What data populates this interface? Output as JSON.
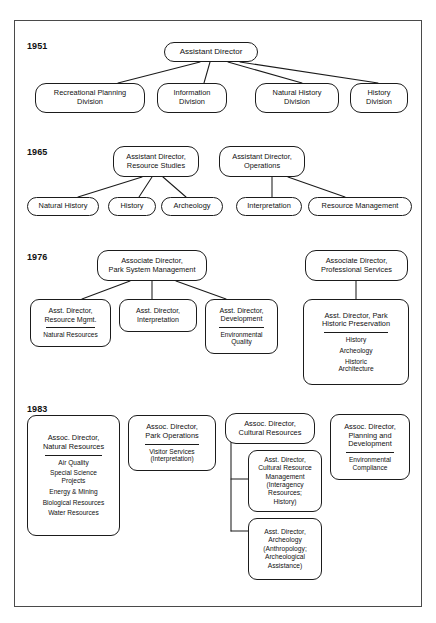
{
  "document": {
    "title": "National Park Service reorganization chart, 1951-1983",
    "border_color": "#4a4a4a",
    "node_border_color": "#1b1b1b",
    "background": "#ffffff"
  },
  "sections": [
    {
      "year": "1951",
      "head": {
        "label": "Assistant Director"
      },
      "children": [
        {
          "label": "Recreational Planning Division"
        },
        {
          "label": "Information Division"
        },
        {
          "label": "Natural History Division"
        },
        {
          "label": "History Division"
        }
      ]
    },
    {
      "year": "1965",
      "groups": [
        {
          "head": {
            "label": "Assistant Director, Resource Studies"
          },
          "children": [
            {
              "label": "Natural History"
            },
            {
              "label": "History"
            },
            {
              "label": "Archeology"
            }
          ]
        },
        {
          "head": {
            "label": "Assistant Director, Operations"
          },
          "children": [
            {
              "label": "Interpretation"
            },
            {
              "label": "Resource Management"
            }
          ]
        }
      ]
    },
    {
      "year": "1976",
      "groups": [
        {
          "head": {
            "label": "Associate Director, Park System Management"
          },
          "children": [
            {
              "label": "Asst. Director, Resource Mgmt.",
              "items": [
                "Natural Resources"
              ]
            },
            {
              "label": "Asst. Director, Interpretation",
              "items": []
            },
            {
              "label": "Asst. Director, Development",
              "items": [
                "Environmental Quality"
              ]
            }
          ]
        },
        {
          "head": {
            "label": "Associate Director, Professional Services"
          },
          "children": [
            {
              "label": "Asst. Director, Park Historic Preservation",
              "items": [
                "History",
                "Archeology",
                "Historic Architecture"
              ]
            }
          ]
        }
      ]
    },
    {
      "year": "1983",
      "columns": [
        {
          "head": {
            "label": "Assoc. Director, Natural Resources"
          },
          "items": [
            "Air Quality",
            "Special Science Projects",
            "Energy & Mining",
            "Biological Resources",
            "Water Resources"
          ]
        },
        {
          "head": {
            "label": "Assoc. Director, Park Operations"
          },
          "items": [
            "Visitor Services (Interpretation)"
          ]
        },
        {
          "head": {
            "label": "Assoc. Director, Cultural Resources"
          },
          "children": [
            {
              "label": "Asst. Director, Cultural Resource Management (Interagency Resources; History)"
            },
            {
              "label": "Asst. Director, Archeology (Anthropology; Archeological Assistance)"
            }
          ]
        },
        {
          "head": {
            "label": "Assoc. Director, Planning and Development"
          },
          "items": [
            "Environmental Compliance"
          ]
        }
      ]
    }
  ],
  "labels": {
    "y1951": "1951",
    "y1965": "1965",
    "y1976": "1976",
    "y1983": "1983",
    "n1951_head": "Assistant Director",
    "n1951_c1_l1": "Recreational Planning",
    "n1951_c1_l2": "Division",
    "n1951_c2_l1": "Information",
    "n1951_c2_l2": "Division",
    "n1951_c3_l1": "Natural History",
    "n1951_c3_l2": "Division",
    "n1951_c4_l1": "History",
    "n1951_c4_l2": "Division",
    "n1965_h1_l1": "Assistant Director,",
    "n1965_h1_l2": "Resource Studies",
    "n1965_h2_l1": "Assistant Director,",
    "n1965_h2_l2": "Operations",
    "n1965_c1": "Natural History",
    "n1965_c2": "History",
    "n1965_c3": "Archeology",
    "n1965_c4": "Interpretation",
    "n1965_c5": "Resource Management",
    "n1976_h1_l1": "Associate Director,",
    "n1976_h1_l2": "Park System Management",
    "n1976_h2_l1": "Associate Director,",
    "n1976_h2_l2": "Professional Services",
    "n1976_a_l1": "Asst. Director,",
    "n1976_a_l2": "Resource Mgmt.",
    "n1976_a_s1": "Natural Resources",
    "n1976_b_l1": "Asst. Director,",
    "n1976_b_l2": "Interpretation",
    "n1976_c_l1": "Asst. Director,",
    "n1976_c_l2": "Development",
    "n1976_c_s1": "Environmental",
    "n1976_c_s2": "Quality",
    "n1976_d_l1": "Asst. Director, Park",
    "n1976_d_l2": "Historic Preservation",
    "n1976_d_s1": "History",
    "n1976_d_s2": "Archeology",
    "n1976_d_s3a": "Historic",
    "n1976_d_s3b": "Architecture",
    "n1983_a_l1": "Assoc. Director,",
    "n1983_a_l2": "Natural Resources",
    "n1983_a_s1": "Air Quality",
    "n1983_a_s2a": "Special Science",
    "n1983_a_s2b": "Projects",
    "n1983_a_s3": "Energy & Mining",
    "n1983_a_s4": "Biological Resources",
    "n1983_a_s5": "Water Resources",
    "n1983_b_l1": "Assoc. Director,",
    "n1983_b_l2": "Park Operations",
    "n1983_b_s1": "Visitor Services",
    "n1983_b_s2": "(Interpretation)",
    "n1983_c_l1": "Assoc. Director,",
    "n1983_c_l2": "Cultural Resources",
    "n1983_c1_l1": "Asst. Director,",
    "n1983_c1_l2": "Cultural Resource",
    "n1983_c1_l3": "Management",
    "n1983_c1_l4": "(Interagency",
    "n1983_c1_l5": "Resources;",
    "n1983_c1_l6": "History)",
    "n1983_c2_l1": "Asst. Director,",
    "n1983_c2_l2": "Archeology",
    "n1983_c2_l3": "(Anthropology;",
    "n1983_c2_l4": "Archeological",
    "n1983_c2_l5": "Assistance)",
    "n1983_d_l1": "Assoc. Director,",
    "n1983_d_l2": "Planning and",
    "n1983_d_l3": "Development",
    "n1983_d_s1": "Environmental",
    "n1983_d_s2": "Compliance"
  }
}
